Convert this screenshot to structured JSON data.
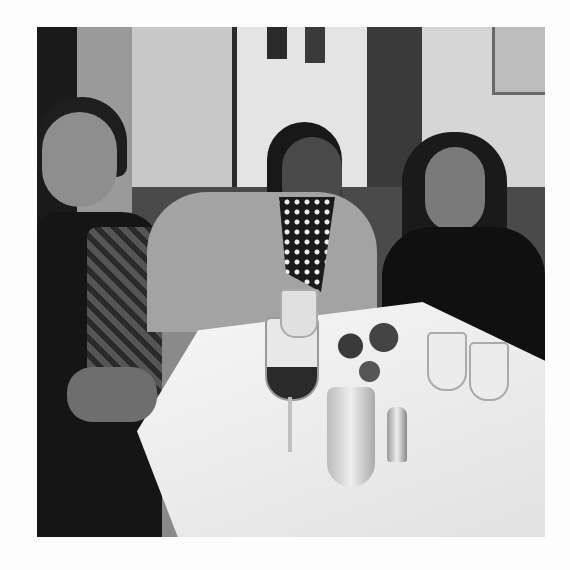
{
  "image": {
    "alt": "Black and white photo of three women seated at a restaurant table with wine glasses and a small flower vase",
    "subjects": [
      "woman-left",
      "woman-center",
      "woman-right"
    ],
    "palette": {
      "background": "#fdfdfd",
      "wall": "#d8d8d8",
      "tablecloth": "#f0f0f0",
      "dark": "#1a1a1a"
    }
  }
}
